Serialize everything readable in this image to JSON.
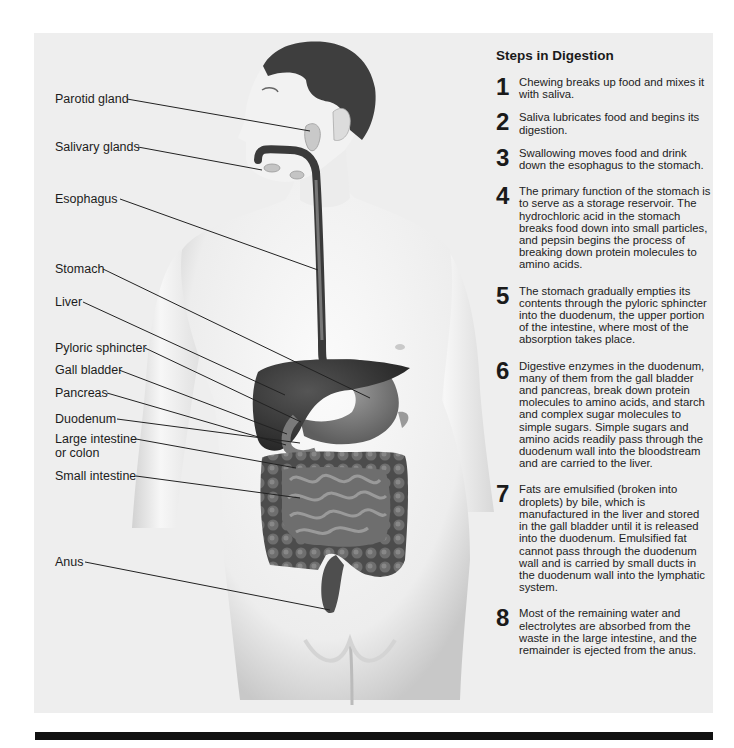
{
  "figure": {
    "panel_color": "#eeeeee",
    "illustration": "male torso showing digestive system organs",
    "labels": [
      {
        "id": "parotid-gland",
        "text": "Parotid gland"
      },
      {
        "id": "salivary-glands",
        "text": "Salivary glands"
      },
      {
        "id": "esophagus",
        "text": "Esophagus"
      },
      {
        "id": "stomach",
        "text": "Stomach"
      },
      {
        "id": "liver",
        "text": "Liver"
      },
      {
        "id": "pyloric-sphincter",
        "text": "Pyloric sphincter"
      },
      {
        "id": "gall-bladder",
        "text": "Gall bladder"
      },
      {
        "id": "pancreas",
        "text": "Pancreas"
      },
      {
        "id": "duodenum",
        "text": "Duodenum"
      },
      {
        "id": "large-intestine",
        "text": "Large intestine",
        "text2": "or colon"
      },
      {
        "id": "small-intestine",
        "text": "Small intestine"
      },
      {
        "id": "anus",
        "text": "Anus"
      }
    ]
  },
  "steps": {
    "title": "Steps in Digestion",
    "items": [
      {
        "num": "1",
        "text": "Chewing breaks up food and mixes it with saliva."
      },
      {
        "num": "2",
        "text": "Saliva lubricates food and begins its digestion."
      },
      {
        "num": "3",
        "text": "Swallowing moves food and drink down the esophagus to the stomach."
      },
      {
        "num": "4",
        "text": "The primary function of the stomach is to serve as a storage reservoir.  The hydrochloric acid in the stomach breaks food down into small particles, and pepsin begins the process of breaking down protein molecules to amino acids."
      },
      {
        "num": "5",
        "text": "The stomach gradually empties its contents through the pyloric sphincter into the duodenum, the upper portion of the intestine, where most of the absorption takes place."
      },
      {
        "num": "6",
        "text": "Digestive enzymes in the duodenum, many of them from the gall bladder and pancreas, break down protein molecules to amino acids, and starch and complex sugar molecules to simple sugars. Simple sugars and amino acids readily pass through the duodenum wall into the bloodstream and are carried to the liver."
      },
      {
        "num": "7",
        "text": "Fats are emulsified (broken into droplets) by bile, which is manufactured in the liver and stored in the gall bladder until it is released into the duodenum. Emulsified fat cannot pass through the duodenum wall and is carried by small ducts in the duodenum wall into the lymphatic system."
      },
      {
        "num": "8",
        "text": "Most of the remaining water and electrolytes are absorbed from the waste in the large intestine, and the remainder is ejected from the anus."
      }
    ]
  }
}
